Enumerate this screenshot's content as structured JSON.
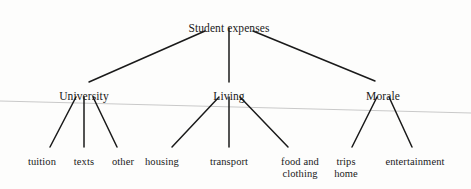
{
  "diagram": {
    "type": "tree",
    "title_node": "Student expenses",
    "root": {
      "label": "Student expenses",
      "x": 229,
      "y": 22
    },
    "branches": [
      {
        "label": "University",
        "x": 84,
        "y": 90
      },
      {
        "label": "Living",
        "x": 229,
        "y": 90
      },
      {
        "label": "Morale",
        "x": 383,
        "y": 90
      }
    ],
    "leaves": [
      {
        "label": "tuition",
        "x": 42,
        "y": 156,
        "parent": "University"
      },
      {
        "label": "texts",
        "x": 84,
        "y": 156,
        "parent": "University"
      },
      {
        "label": "other",
        "x": 123,
        "y": 156,
        "parent": "University"
      },
      {
        "label": "housing",
        "x": 162,
        "y": 156,
        "parent": "Living"
      },
      {
        "label": "transport",
        "x": 229,
        "y": 156,
        "parent": "Living"
      },
      {
        "label": "food and\nclothing",
        "x": 300,
        "y": 156,
        "parent": "Living"
      },
      {
        "label": "trips\nhome",
        "x": 346,
        "y": 156,
        "parent": "Morale"
      },
      {
        "label": "entertainment",
        "x": 415,
        "y": 156,
        "parent": "Morale"
      }
    ],
    "edges": [
      {
        "from": "Student expenses",
        "to": "University",
        "x1": 205,
        "y1": 31,
        "x2": 89,
        "y2": 82
      },
      {
        "from": "Student expenses",
        "to": "Living",
        "x1": 229,
        "y1": 28,
        "x2": 229,
        "y2": 82
      },
      {
        "from": "Student expenses",
        "to": "Morale",
        "x1": 253,
        "y1": 31,
        "x2": 375,
        "y2": 81
      },
      {
        "from": "University",
        "to": "tuition",
        "x1": 76,
        "y1": 97,
        "x2": 50,
        "y2": 147
      },
      {
        "from": "University",
        "to": "texts",
        "x1": 84,
        "y1": 97,
        "x2": 84,
        "y2": 147
      },
      {
        "from": "University",
        "to": "other",
        "x1": 93,
        "y1": 97,
        "x2": 117,
        "y2": 147
      },
      {
        "from": "Living",
        "to": "housing",
        "x1": 219,
        "y1": 97,
        "x2": 172,
        "y2": 147
      },
      {
        "from": "Living",
        "to": "transport",
        "x1": 229,
        "y1": 97,
        "x2": 229,
        "y2": 147
      },
      {
        "from": "Living",
        "to": "food and clothing",
        "x1": 240,
        "y1": 97,
        "x2": 288,
        "y2": 147
      },
      {
        "from": "Morale",
        "to": "trips home",
        "x1": 377,
        "y1": 97,
        "x2": 352,
        "y2": 147
      },
      {
        "from": "Morale",
        "to": "entertainment",
        "x1": 389,
        "y1": 97,
        "x2": 412,
        "y2": 147
      }
    ],
    "artifact_line": {
      "x1": 0,
      "y1": 101,
      "x2": 471,
      "y2": 113
    },
    "colors": {
      "ink": "#1a1a1a",
      "page": "#fdfdfc",
      "artifact": "#c9c9c9"
    }
  }
}
